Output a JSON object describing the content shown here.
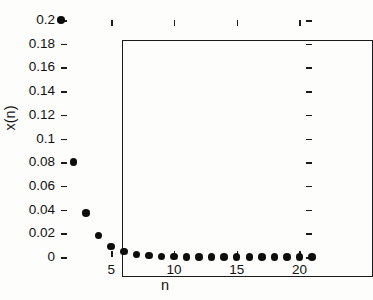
{
  "figure": {
    "background_color": "#fdfdfb",
    "foreground_color": "#111111",
    "marker_color": "#0d0d0d"
  },
  "axis_titles": {
    "y": "x(n)",
    "x": "n"
  },
  "chart_data": {
    "type": "scatter",
    "title": "",
    "xlabel": "n",
    "ylabel": "x(n)",
    "xlim": [
      1,
      21
    ],
    "ylim": [
      0,
      0.2
    ],
    "grid": false,
    "legend": null,
    "marker": "filled-circle",
    "x": [
      1,
      2,
      3,
      4,
      5,
      6,
      7,
      8,
      9,
      10,
      11,
      12,
      13,
      14,
      15,
      16,
      17,
      18,
      19,
      20,
      21
    ],
    "values": [
      0.2,
      0.08,
      0.037,
      0.018,
      0.009,
      0.0045,
      0.0022,
      0.0011,
      0.0006,
      0.0003,
      0.00015,
      8e-05,
      4e-05,
      2e-05,
      1e-05,
      5e-06,
      2.5e-06,
      1.2e-06,
      6e-07,
      3e-07,
      1.5e-07
    ],
    "xticks": [
      5,
      10,
      15,
      20
    ],
    "xticklabels": [
      "5",
      "10",
      "15",
      "20"
    ],
    "yticks": [
      0,
      0.02,
      0.04,
      0.06,
      0.08,
      0.1,
      0.12,
      0.14,
      0.16,
      0.18,
      0.2
    ],
    "yticklabels": [
      "0",
      "0.02",
      "0.04",
      "0.06",
      "0.08",
      "0.1",
      "0.12",
      "0.14",
      "0.16",
      "0.18",
      "0.2"
    ],
    "xminorticks": [
      1,
      2,
      3,
      4,
      6,
      7,
      8,
      9,
      11,
      12,
      13,
      14,
      16,
      17,
      18,
      19,
      21
    ]
  }
}
